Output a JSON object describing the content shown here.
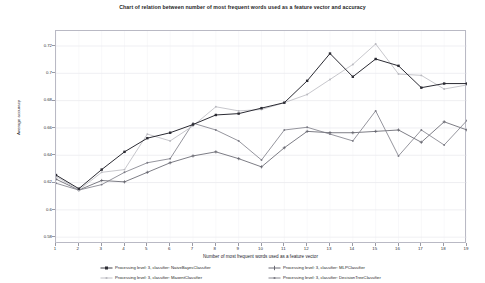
{
  "title": "Chart of relation between number of most frequent words used as a feature vector and accuracy",
  "axes": {
    "xlabel": "Number of most frequent words used as a feature vector",
    "ylabel": "Average accuracy",
    "yticks": [
      "0.58",
      "0.6",
      "0.62",
      "0.64",
      "0.66",
      "0.68",
      "0.7",
      "0.72"
    ],
    "xticks": [
      "1",
      "2",
      "3",
      "4",
      "5",
      "6",
      "7",
      "8",
      "9",
      "10",
      "11",
      "12",
      "13",
      "14",
      "15",
      "16",
      "17",
      "18",
      "19"
    ]
  },
  "legend": {
    "items": [
      {
        "label": "Processing level: 3, classifier: NaiveBayesClassifier",
        "color": "#2b2b33",
        "marker": "square"
      },
      {
        "label": "Processing level: 3, classifier: MLPClassifier",
        "color": "#5c5c66",
        "marker": "plus"
      },
      {
        "label": "Processing level: 3, classifier: MaxentClassifier",
        "color": "#b9b9bf",
        "marker": "dot"
      },
      {
        "label": "Processing level: 3, classifier: DecisionTreeClassifier",
        "color": "#7a7a84",
        "marker": "dot"
      }
    ]
  },
  "chart_data": {
    "type": "line",
    "title": "Chart of relation between number of most frequent words used as a feature vector and accuracy",
    "xlabel": "Number of most frequent words used as a feature vector",
    "ylabel": "Average accuracy",
    "x": [
      1,
      2,
      3,
      4,
      5,
      6,
      7,
      8,
      9,
      10,
      11,
      12,
      13,
      14,
      15,
      16,
      17,
      18,
      19
    ],
    "xlim": [
      1,
      19
    ],
    "ylim": [
      0.575,
      0.731
    ],
    "grid": true,
    "legend_position": "bottom",
    "series": [
      {
        "name": "Processing level: 3, classifier: NaiveBayesClassifier",
        "color": "#2b2b33",
        "marker": "square",
        "values": [
          0.6255,
          0.6155,
          0.6295,
          0.6425,
          0.6525,
          0.6565,
          0.6625,
          0.6695,
          0.6705,
          0.6745,
          0.6785,
          0.6945,
          0.7145,
          0.6975,
          0.7105,
          0.7055,
          0.6895,
          0.6925,
          0.6925
        ]
      },
      {
        "name": "Processing level: 3, classifier: MaxentClassifier",
        "color": "#b9b9bf",
        "marker": "dot",
        "values": [
          0.6245,
          0.6145,
          0.6275,
          0.6295,
          0.6555,
          0.6505,
          0.6615,
          0.6755,
          0.6725,
          0.6735,
          0.6785,
          0.6845,
          0.6955,
          0.7065,
          0.7215,
          0.6995,
          0.6985,
          0.6885,
          0.6915
        ]
      },
      {
        "name": "Processing level: 3, classifier: MLPClassifier",
        "color": "#5c5c66",
        "marker": "plus",
        "values": [
          0.6225,
          0.6145,
          0.6215,
          0.6205,
          0.6275,
          0.6345,
          0.6395,
          0.6425,
          0.6375,
          0.6315,
          0.6455,
          0.6575,
          0.6565,
          0.6565,
          0.6575,
          0.6585,
          0.6495,
          0.6645,
          0.6585
        ]
      },
      {
        "name": "Processing level: 3, classifier: DecisionTreeClassifier",
        "color": "#7a7a84",
        "marker": "dot",
        "values": [
          0.6195,
          0.6145,
          0.6185,
          0.6275,
          0.6345,
          0.6375,
          0.6635,
          0.6585,
          0.6505,
          0.6365,
          0.6585,
          0.6605,
          0.6555,
          0.6505,
          0.6725,
          0.6395,
          0.6585,
          0.6475,
          0.6655
        ]
      }
    ]
  }
}
